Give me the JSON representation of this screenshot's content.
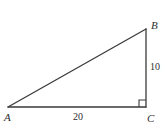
{
  "figure": {
    "kind": "right-triangle-diagram",
    "width": 164,
    "height": 128,
    "background_color": "#ffffff",
    "stroke_color": "#3a3a3a",
    "text_color": "#2e2e2e"
  },
  "vertices": {
    "a": {
      "label": "A",
      "x": 8,
      "y": 107
    },
    "b": {
      "label": "B",
      "x": 146,
      "y": 29
    },
    "c": {
      "label": "C",
      "x": 146,
      "y": 107
    }
  },
  "sides": {
    "ac": {
      "label": "20",
      "name": "base-side-ac"
    },
    "bc": {
      "label": "10",
      "name": "vertical-side-bc"
    },
    "ab": {
      "label": "",
      "name": "hypotenuse-ab"
    }
  },
  "markers": {
    "right_angle_at": "C"
  }
}
